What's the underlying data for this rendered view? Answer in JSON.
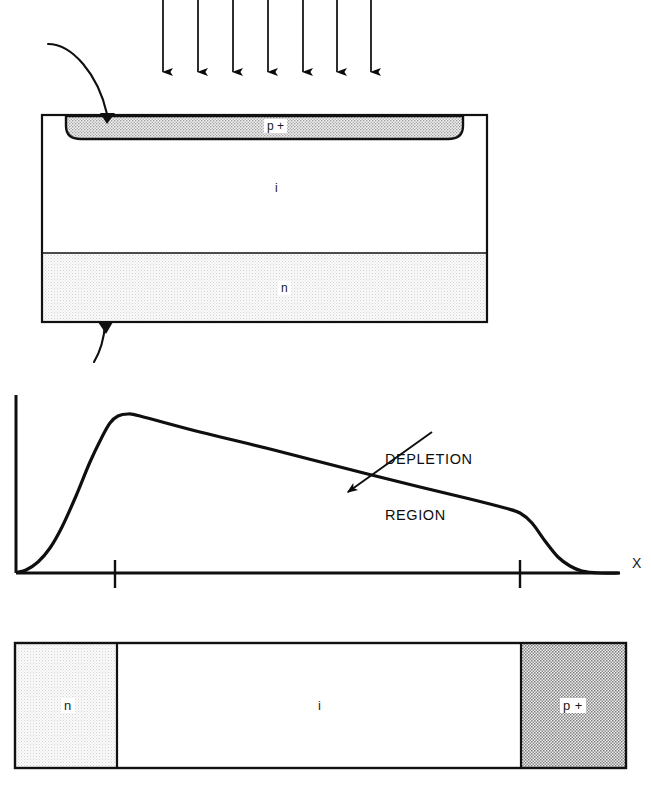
{
  "figure": {
    "colors": {
      "ink": "#000000",
      "p_plus_fill": "#c9c9c9",
      "n_fill": "#ededed",
      "i_fill": "#ffffff",
      "background": "#ffffff"
    }
  },
  "top_device": {
    "name": "pin-photodiode-cross-section",
    "illumination": {
      "label": "incident-light-arrows",
      "arrow_count": 7,
      "direction": "down",
      "arrow_x_positions": [
        163,
        198,
        233,
        268,
        303,
        337,
        371
      ],
      "arrow_top_y": 0,
      "arrow_tip_y": 82
    },
    "body": {
      "x": 42,
      "y": 115,
      "width": 445,
      "height": 207
    },
    "layers": [
      {
        "id": "p-plus-layer",
        "label": "p +",
        "label_x": 264,
        "label_y": 118,
        "fill": "dotted-medium"
      },
      {
        "id": "i-layer",
        "label": "i",
        "label_x": 272,
        "label_y": 181,
        "fill": "white"
      },
      {
        "id": "n-layer",
        "label": "n",
        "label_x": 278,
        "label_y": 281,
        "fill": "dotted-light"
      }
    ],
    "leads": [
      {
        "id": "top-contact-lead",
        "from": "upper-left",
        "to": "p-plus-layer"
      },
      {
        "id": "bottom-contact-lead",
        "from": "n-layer-bottom",
        "to": "lower-left"
      }
    ]
  },
  "field_graph": {
    "name": "electric-field-profile-graph",
    "callout": {
      "line1": "DEPLETION",
      "line2": "REGION",
      "x": 385,
      "y": 414
    },
    "axis_label_x": "X",
    "axis_label_x_pos": {
      "x": 632,
      "y": 562
    }
  },
  "chart_data": {
    "type": "line",
    "xlabel": "X",
    "ylabel": "",
    "grid": false,
    "legend": null,
    "axes": {
      "origin_px": [
        16,
        573
      ],
      "x_axis_end_px": [
        620,
        573
      ],
      "y_axis_top_px": [
        16,
        395
      ],
      "xlim": [
        0,
        620
      ],
      "ylim": [
        0,
        180
      ]
    },
    "x_ticks_px": [
      115,
      520
    ],
    "x_tick_labels": [
      "",
      ""
    ],
    "annotations": [
      {
        "text": "DEPLETION REGION",
        "arrow_from_px": [
          432,
          432
        ],
        "arrow_to_px": [
          348,
          492
        ],
        "text_px": [
          385,
          414
        ]
      }
    ],
    "series": [
      {
        "name": "electric field",
        "points_px": [
          [
            18,
            572
          ],
          [
            26,
            570
          ],
          [
            38,
            562
          ],
          [
            50,
            548
          ],
          [
            62,
            527
          ],
          [
            76,
            496
          ],
          [
            90,
            462
          ],
          [
            102,
            437
          ],
          [
            110,
            423
          ],
          [
            118,
            416
          ],
          [
            128,
            414
          ],
          [
            140,
            416
          ],
          [
            200,
            432
          ],
          [
            270,
            449
          ],
          [
            348,
            469
          ],
          [
            420,
            487
          ],
          [
            470,
            499
          ],
          [
            505,
            508
          ],
          [
            520,
            513
          ],
          [
            532,
            523
          ],
          [
            545,
            541
          ],
          [
            558,
            557
          ],
          [
            570,
            566
          ],
          [
            582,
            571
          ],
          [
            600,
            573
          ],
          [
            618,
            573
          ]
        ],
        "description": "Field is near zero at left edge, rises steeply through the p+ junction to a peak just past the first tick, decreases linearly across the intrinsic depletion region, then falls rapidly to zero past the second tick at the n boundary."
      }
    ]
  },
  "bottom_device": {
    "name": "pin-structure-lateral-view",
    "body": {
      "x": 15,
      "y": 643,
      "width": 611,
      "height": 125
    },
    "regions": [
      {
        "id": "n-region",
        "label": "n",
        "x": 15,
        "width": 102,
        "fill": "dotted-light",
        "label_x": 61,
        "label_y": 698
      },
      {
        "id": "i-region",
        "label": "i",
        "x": 117,
        "width": 404,
        "fill": "white",
        "label_x": 315,
        "label_y": 698
      },
      {
        "id": "p-plus-region",
        "label": "p +",
        "x": 521,
        "width": 105,
        "fill": "dotted-dark",
        "label_x": 565,
        "label_y": 698
      }
    ]
  }
}
